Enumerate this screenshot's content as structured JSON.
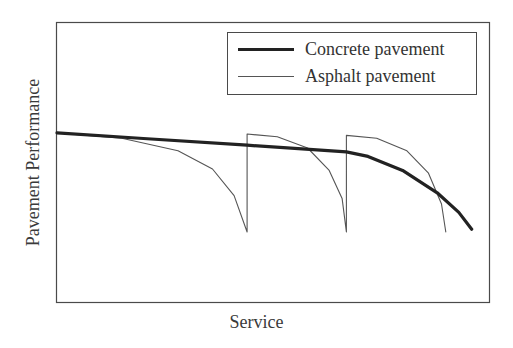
{
  "chart_data": {
    "type": "line",
    "title": "",
    "xlabel": "Service",
    "ylabel": "Pavement Performance",
    "grid": false,
    "ticks": false,
    "legend_position": "upper right",
    "x_range": [
      0,
      100
    ],
    "y_range": [
      0,
      100
    ],
    "series": [
      {
        "name": "Concrete pavement",
        "style": "thick",
        "color": "#222222",
        "points": [
          [
            0,
            60.4
          ],
          [
            20,
            58.4
          ],
          [
            44,
            56
          ],
          [
            67,
            53.6
          ],
          [
            72,
            52
          ],
          [
            80,
            47
          ],
          [
            88,
            39
          ],
          [
            93,
            32
          ],
          [
            96,
            26
          ]
        ]
      },
      {
        "name": "Asphalt pavement",
        "style": "thin",
        "color": "#555555",
        "points": [
          [
            0,
            60.4
          ],
          [
            15,
            58.5
          ],
          [
            28,
            54
          ],
          [
            36,
            47.5
          ],
          [
            41,
            38
          ],
          [
            44,
            25
          ],
          [
            44,
            60
          ],
          [
            51,
            59
          ],
          [
            58,
            55
          ],
          [
            63,
            47
          ],
          [
            66,
            37
          ],
          [
            67,
            25
          ],
          [
            67,
            59.5
          ],
          [
            74,
            58.5
          ],
          [
            81,
            54
          ],
          [
            86,
            46
          ],
          [
            89,
            35
          ],
          [
            90,
            25
          ]
        ]
      }
    ]
  },
  "legend": {
    "items": [
      {
        "label": "Concrete pavement"
      },
      {
        "label": "Asphalt pavement"
      }
    ]
  },
  "axes": {
    "xlabel": "Service",
    "ylabel": "Pavement Performance"
  }
}
